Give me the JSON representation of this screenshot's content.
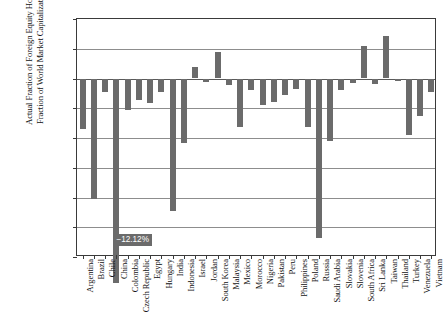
{
  "chart_data": {
    "type": "bar",
    "title": "",
    "subtitle": "",
    "xlabel": "",
    "ylabel": "Actual Fraction of Foreign Equity Holdings Less Fraction of World Market Capitalization in 2012",
    "ylabel_lines": [
      "Actual Fraction of Foreign Equity Holdings Less",
      "Fraction of World Market Capitalization in 2012"
    ],
    "ylim": [
      -3.0,
      1.0
    ],
    "ytick_values": [
      1.0,
      0.5,
      0.0,
      -0.5,
      -1.0,
      -1.5,
      -2.0,
      -2.5,
      -3.0
    ],
    "ytick_labels": [
      "1.0%",
      "0.5%",
      "0.0%",
      "−0.5%",
      "−1.0%",
      "−1.5%",
      "−2.0%",
      "−2.5%",
      "−3.0%"
    ],
    "grid": true,
    "legend": false,
    "legend_position": "none",
    "bar_color": "#6b6b6b",
    "axis_color": "#3a3a3a",
    "grid_color": "#8d8d8d",
    "units": "percent",
    "categories": [
      "Argentina",
      "Brazil",
      "Chile",
      "China",
      "Colombia",
      "Czech Republic",
      "Egypt",
      "Hungary",
      "India",
      "Indonesia",
      "Israel",
      "Jordan",
      "South Korea",
      "Malaysia",
      "Mexico",
      "Morocco",
      "Nigeria",
      "Pakistan",
      "Peru",
      "Philippines",
      "Poland",
      "Russia",
      "Saudi Arabia",
      "Slovakia",
      "Slovenia",
      "South Africa",
      "Sri Lanka",
      "Taiwan",
      "Thailand",
      "Turkey",
      "Venezuela",
      "Vietnam"
    ],
    "values": [
      -0.85,
      -2.03,
      -0.22,
      -12.12,
      -0.53,
      -0.36,
      -0.41,
      -0.23,
      -2.23,
      -1.08,
      0.2,
      -0.06,
      0.45,
      -0.11,
      -0.82,
      -0.19,
      -0.45,
      -0.39,
      -0.28,
      -0.17,
      -0.82,
      -2.68,
      -1.05,
      -0.19,
      -0.08,
      0.54,
      -0.1,
      0.72,
      -0.04,
      -0.95,
      -0.63,
      -0.22
    ],
    "annotations": [
      {
        "category": "China",
        "text": "−12.12%",
        "kind": "clipped-bar-data-label",
        "reason": "bar extends below axis minimum"
      }
    ]
  }
}
